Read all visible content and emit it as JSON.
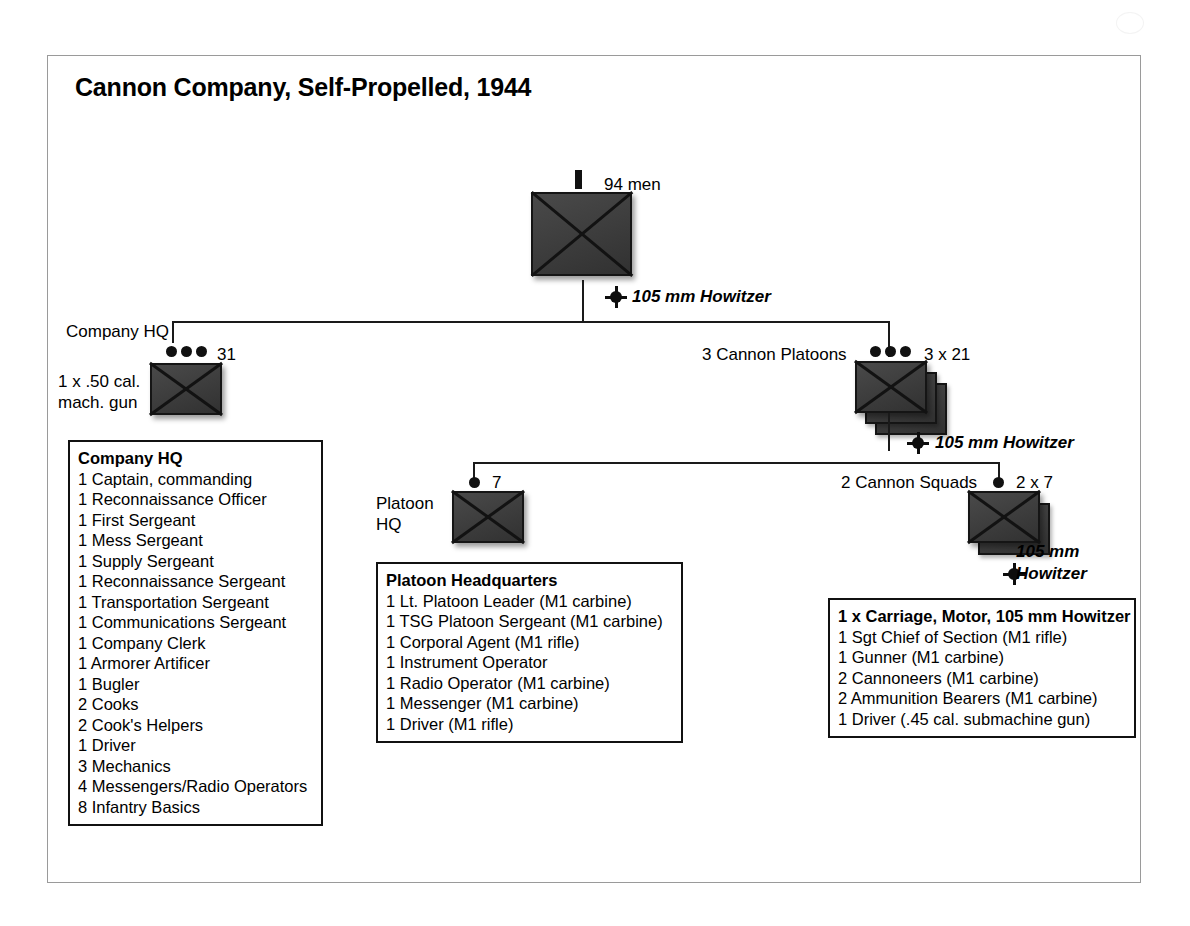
{
  "title": "Cannon Company, Self-Propelled, 1944",
  "company": {
    "strength_label": "94 men",
    "echelon": "bar",
    "howitzer_label": "105 mm Howitzer"
  },
  "company_hq": {
    "name_label": "Company HQ",
    "strength_label": "31",
    "echelon": "three-dots",
    "weapon_note_line1": "1 x .50 cal.",
    "weapon_note_line2": "mach. gun"
  },
  "cannon_platoons": {
    "name_label": "3 Cannon Platoons",
    "strength_label": "3 x 21",
    "echelon": "three-dots",
    "howitzer_label": "105 mm Howitzer"
  },
  "platoon_hq": {
    "name_line1": "Platoon",
    "name_line2": "HQ",
    "strength_label": "7",
    "echelon": "one-dot"
  },
  "cannon_squads": {
    "name_label": "2 Cannon Squads",
    "strength_label": "2 x 7",
    "echelon": "one-dot",
    "howitzer_label_line1": "105 mm",
    "howitzer_label_line2": "Howitzer"
  },
  "boxes": {
    "company_hq": {
      "title": "Company HQ",
      "items": [
        "1 Captain, commanding",
        "1 Reconnaissance Officer",
        "1 First Sergeant",
        "1 Mess Sergeant",
        "1 Supply Sergeant",
        "1 Reconnaissance Sergeant",
        "1 Transportation Sergeant",
        "1 Communications Sergeant",
        "1 Company Clerk",
        "1 Armorer Artificer",
        "1 Bugler",
        "2 Cooks",
        "2 Cook's Helpers",
        "1 Driver",
        "3 Mechanics",
        "4 Messengers/Radio Operators",
        "8 Infantry Basics"
      ]
    },
    "platoon_hq": {
      "title": "Platoon Headquarters",
      "items": [
        "1 Lt. Platoon Leader (M1 carbine)",
        "1 TSG Platoon Sergeant (M1 carbine)",
        "1 Corporal Agent (M1 rifle)",
        "1 Instrument Operator",
        "1 Radio Operator (M1 carbine)",
        "1 Messenger (M1 carbine)",
        "1 Driver (M1 rifle)"
      ]
    },
    "cannon_squad": {
      "title": "1 x Carriage, Motor, 105 mm Howitzer",
      "items": [
        "1 Sgt Chief of Section (M1 rifle)",
        "1 Gunner (M1 carbine)",
        "2 Cannoneers (M1 carbine)",
        "2 Ammunition Bearers (M1 carbine)",
        "1 Driver (.45 cal. submachine gun)"
      ]
    }
  },
  "colors": {
    "symbol_fill": "#3c3c3c",
    "symbol_stroke": "#151515",
    "line": "#1a1a1a",
    "page_border": "#9a9a9a",
    "background": "#ffffff"
  }
}
